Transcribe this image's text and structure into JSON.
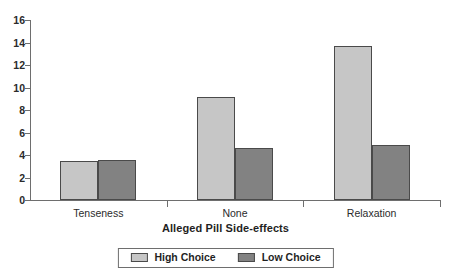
{
  "chart_data": {
    "type": "bar",
    "title": "",
    "xlabel": "Alleged Pill Side-effects",
    "ylabel": "",
    "ylim": [
      0,
      16
    ],
    "yticks": [
      0,
      2,
      4,
      6,
      8,
      10,
      12,
      14,
      16
    ],
    "grid": false,
    "legend_position": "bottom",
    "categories": [
      "Tenseness",
      "None",
      "Relaxation"
    ],
    "series": [
      {
        "name": "High Choice",
        "color": "#c6c6c6",
        "values": [
          3.5,
          9.2,
          13.7
        ]
      },
      {
        "name": "Low Choice",
        "color": "#828282",
        "values": [
          3.6,
          4.6,
          4.9
        ]
      }
    ]
  },
  "legend": {
    "entries": [
      {
        "label": "High Choice"
      },
      {
        "label": "Low Choice"
      }
    ]
  }
}
